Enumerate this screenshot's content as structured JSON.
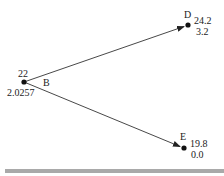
{
  "diagram": {
    "type": "decision-tree",
    "colors": {
      "line": "#333333",
      "node": "#111111",
      "text": "#222222",
      "bottom_bar": "#a9a9a9"
    },
    "nodes": {
      "B": {
        "name": "B",
        "top_value": "22",
        "bottom_value": "2.0257"
      },
      "D": {
        "name": "D",
        "top_value": "24.2",
        "bottom_value": "3.2"
      },
      "E": {
        "name": "E",
        "top_value": "19.8",
        "bottom_value": "0.0"
      }
    },
    "edges": [
      {
        "from": "B",
        "to": "D"
      },
      {
        "from": "B",
        "to": "E"
      }
    ]
  }
}
